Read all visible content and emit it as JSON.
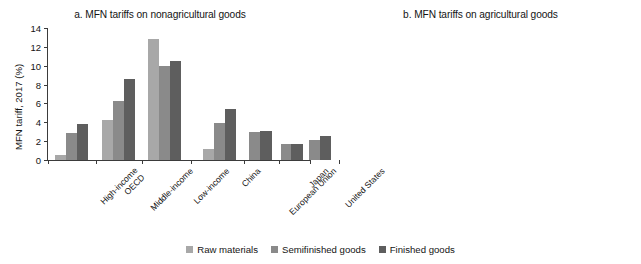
{
  "ylabel": "MFN tariff, 2017 (%)",
  "legend": {
    "items": [
      {
        "label": "Raw materials",
        "color": "#a8a8a8"
      },
      {
        "label": "Semifinished goods",
        "color": "#8a8a8a"
      },
      {
        "label": "Finished goods",
        "color": "#5e5e5e"
      }
    ]
  },
  "chart_data": [
    {
      "type": "bar",
      "title": "a. MFN tariffs on nonagricultural goods",
      "xlabel": "",
      "ylabel": "MFN tariff, 2017 (%)",
      "ylim": [
        0,
        14
      ],
      "yticks": [
        0,
        2,
        4,
        6,
        8,
        10,
        12,
        14
      ],
      "grid": false,
      "legend_position": "bottom-center",
      "categories": [
        "High-income OECD",
        "Middle-income",
        "Low-income",
        "China",
        "European Union",
        "Japan",
        "United States"
      ],
      "series": [
        {
          "name": "Raw materials",
          "values": [
            0.5,
            4.2,
            12.8,
            1.15,
            0.0,
            0.0,
            0.0
          ]
        },
        {
          "name": "Semifinished goods",
          "values": [
            2.9,
            6.3,
            10.0,
            3.9,
            3.0,
            1.65,
            2.1
          ]
        },
        {
          "name": "Finished goods",
          "values": [
            3.8,
            8.6,
            10.5,
            5.45,
            3.1,
            1.7,
            2.5
          ]
        }
      ]
    },
    {
      "type": "bar",
      "title": "b. MFN tariffs on agricultural goods",
      "xlabel": "",
      "ylabel": "MFN tariff, 2017 (%)",
      "ylim": [
        0,
        30
      ],
      "yticks": [
        0,
        5,
        10,
        15,
        20,
        25,
        30
      ],
      "grid": false,
      "legend_position": "bottom-center",
      "categories": [
        "High-income OECD",
        "Middle-income",
        "Low-income",
        "China",
        "European Union",
        "Japan",
        "United States"
      ],
      "series": [
        {
          "name": "Raw materials",
          "values": [
            16.5,
            10.8,
            10.7,
            12.4,
            3.8,
            11.6,
            2.4
          ]
        },
        {
          "name": "Semifinished goods",
          "values": [
            16.1,
            12.8,
            20.2,
            12.1,
            15.1,
            9.4,
            7.9
          ]
        },
        {
          "name": "Finished goods",
          "values": [
            20.9,
            19.3,
            16.0,
            25.6,
            14.6,
            19.6,
            20.6
          ]
        }
      ]
    }
  ],
  "xlabels": [
    {
      "lines": [
        "High-income",
        "OECD"
      ]
    },
    {
      "lines": [
        "Middle-income"
      ]
    },
    {
      "lines": [
        "Low-income"
      ]
    },
    {
      "lines": [
        "China"
      ]
    },
    {
      "lines": [
        "European Union"
      ]
    },
    {
      "lines": [
        "Japan"
      ]
    },
    {
      "lines": [
        "United States"
      ]
    }
  ]
}
